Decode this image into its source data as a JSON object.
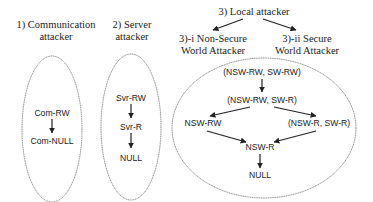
{
  "groups": {
    "communication": {
      "title_line1": "1) Communication",
      "title_line2": "attacker",
      "nodes": [
        "Com-RW",
        "Com-NULL"
      ]
    },
    "server": {
      "title_line1": "2) Server",
      "title_line2": "attacker",
      "nodes": [
        "Svr-RW",
        "Svr-R",
        "NULL"
      ]
    },
    "local": {
      "title": "3) Local attacker",
      "sub_nonsecure_line1": "3)-i Non-Secure",
      "sub_nonsecure_line2": "World Attacker",
      "sub_secure_line1": "3)-ii Secure",
      "sub_secure_line2": "World Attacker",
      "nodes": {
        "top": "(NSW-RW, SW-RW)",
        "second": "(NSW-RW, SW-R)",
        "left": "NSW-RW",
        "right": "(NSW-R, SW-R)",
        "merge": "NSW-R",
        "bottom": "NULL"
      }
    }
  }
}
